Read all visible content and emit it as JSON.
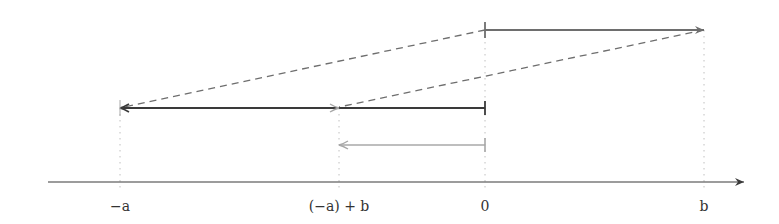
{
  "diagram": {
    "title": "",
    "type": "number-line vector addition",
    "axis": {
      "labels": [
        {
          "id": "neg-a",
          "text": "−a",
          "value": -1.0
        },
        {
          "id": "neg-a-plus-b",
          "text": "(−a) + b",
          "value": -0.4
        },
        {
          "id": "zero",
          "text": "0",
          "value": 0.0
        },
        {
          "id": "b",
          "text": "b",
          "value": 0.6
        }
      ]
    },
    "vectors": [
      {
        "id": "vector-b",
        "from": 0.0,
        "to": 0.6,
        "level": "top",
        "style": "solid"
      },
      {
        "id": "vector-neg-a",
        "from": 0.0,
        "to": -1.0,
        "level": "middle",
        "style": "solid"
      },
      {
        "id": "vector-b-shifted",
        "from": -1.0,
        "to": -0.4,
        "level": "middle",
        "style": "solid-light"
      },
      {
        "id": "vector-result",
        "from": 0.0,
        "to": -0.4,
        "level": "bottom",
        "style": "solid-light"
      }
    ],
    "dashed_links": [
      {
        "id": "dash-origin",
        "from_value": 0.0,
        "from_level": "top",
        "to_value": -1.0,
        "to_level": "middle"
      },
      {
        "id": "dash-tip",
        "from_value": 0.6,
        "from_level": "top",
        "to_value": -0.4,
        "to_level": "middle"
      }
    ],
    "colors": {
      "dark": "#3a3a3a",
      "medium": "#6e6e6e",
      "light": "#a8a8a8",
      "dotted": "#c0c0c0"
    }
  }
}
